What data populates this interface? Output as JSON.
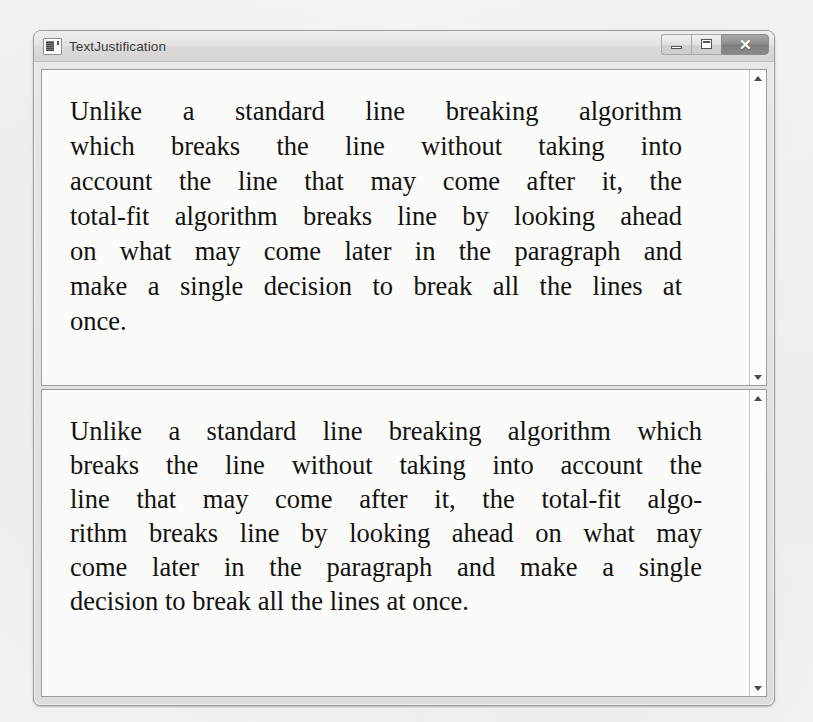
{
  "background": {
    "color": "#f4f3f1"
  },
  "window": {
    "title": "TextJustification",
    "icon": "application-icon",
    "controls": {
      "minimize_label": "—",
      "maximize_label": "□",
      "close_label": "✕"
    }
  },
  "panels": [
    {
      "name": "justified-no-hyphenation",
      "scrollbar": {
        "up_arrow": "▲",
        "down_arrow": "▼"
      },
      "full_text": "Unlike a standard line breaking algorithm which breaks the line without taking into account the line that may come after it, the total-fit algorithm breaks line by looking ahead on what may come later in the paragraph and make a single decision to break all the lines at once.",
      "lines": [
        "Unlike a standard line breaking algorithm",
        "which breaks the line without taking into",
        "account the line that may come after it, the",
        "total-fit algorithm breaks line by looking ahead",
        "on what may come later in the paragraph and",
        "make a single decision to break all the lines at",
        "once."
      ]
    },
    {
      "name": "justified-with-hyphenation",
      "scrollbar": {
        "up_arrow": "▲",
        "down_arrow": "▼"
      },
      "full_text": "Unlike a standard line breaking algorithm which breaks the line without taking into account the line that may come after it, the total-fit algo-rithm breaks line by looking ahead on what may come later in the paragraph and make a single decision to break all the lines at once.",
      "lines": [
        "Unlike a standard line breaking algorithm which",
        "breaks the line without taking into account the",
        "line that may come after it, the total-fit algo-",
        "rithm breaks line by looking ahead on what may",
        "come later in the paragraph and make a single",
        "decision to break all the lines at once."
      ]
    }
  ]
}
